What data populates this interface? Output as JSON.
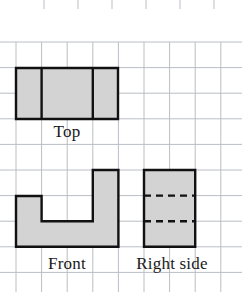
{
  "worksheet": {
    "title": "Orthographic views on graph paper",
    "background_color": "#ffffff",
    "grid": {
      "line_color": "#b9bec6",
      "line_width": 1,
      "cell_size": 25.6,
      "x_lines": [
        16,
        41.6,
        67.2,
        92.8,
        118.4,
        144,
        169.6,
        195.2,
        220.8
      ],
      "y_lines": [
        42,
        67.6,
        93.2,
        118.8,
        144.4,
        170,
        195.6,
        221.2,
        246.8,
        272.4
      ],
      "top_ticks": {
        "y_start": 0,
        "y_end": 9,
        "x_positions": [
          16,
          41.6,
          67.2,
          92.8,
          118.4,
          144,
          169.6,
          195.2,
          220.8
        ]
      }
    },
    "shape_style": {
      "fill_color": "#d3d3d3",
      "stroke_color": "#111111",
      "stroke_width": 2.4,
      "hidden_line_color": "#111111",
      "hidden_line_width": 2.4,
      "hidden_line_dash": "7,5"
    },
    "figures": [
      {
        "name": "top-view",
        "label": "Top",
        "label_x": 67,
        "label_y": 132,
        "outline": "16,68 118,68 118,119 16,119",
        "interior_lines": [
          "41.6,68 41.6,119",
          "92.8,68 92.8,119"
        ],
        "hidden_lines": []
      },
      {
        "name": "front-view",
        "label": "Front",
        "label_x": 67,
        "label_y": 264,
        "outline": "16,196 41.6,196 41.6,221.2 92.8,221.2 92.8,170 118.4,170 118.4,246.8 16,246.8",
        "interior_lines": [],
        "hidden_lines": []
      },
      {
        "name": "right-side-view",
        "label": "Right side",
        "label_x": 168,
        "label_y": 264,
        "outline": "144,170 195.2,170 195.2,246.8 144,246.8",
        "interior_lines": [],
        "hidden_lines": [
          "144,195.6 195.2,195.6",
          "144,221.2 195.2,221.2"
        ]
      }
    ]
  }
}
